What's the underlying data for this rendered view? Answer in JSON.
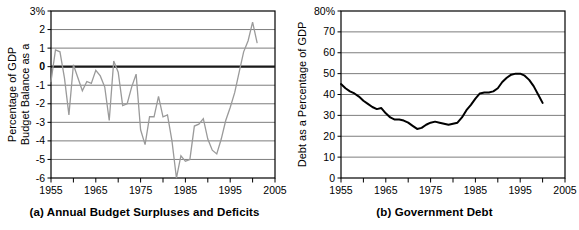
{
  "figure": {
    "panels": [
      {
        "id": "a",
        "caption": "(a) Annual Budget Surpluses and Deficits",
        "chart_data": {
          "type": "line",
          "title": "(a) Annual Budget Surpluses and Deficits",
          "xlabel": "Years",
          "ylabel": "Budget Balance as a Percentage of GDP",
          "xlim": [
            1955,
            2005
          ],
          "ylim": [
            -6,
            3
          ],
          "xticks": [
            1955,
            1965,
            1975,
            1985,
            1995,
            2005
          ],
          "xtick_labels": [
            "1955",
            "1965",
            "1975",
            "1985",
            "1995",
            "2005"
          ],
          "minor_xtick_step": 5,
          "yticks": [
            -6,
            -5,
            -4,
            -3,
            -2,
            -1,
            0,
            1,
            2,
            3
          ],
          "ytick_labels": [
            "-6",
            "-5",
            "-4",
            "-3",
            "-2",
            "-1",
            "0",
            "1",
            "2",
            "3%"
          ],
          "grid": true,
          "zero_line": 0,
          "line_color": "#9a9a9a",
          "series": [
            {
              "name": "Budget balance as a percentage of GDP",
              "x": [
                1955,
                1956,
                1957,
                1958,
                1959,
                1960,
                1961,
                1962,
                1963,
                1964,
                1965,
                1966,
                1967,
                1968,
                1969,
                1970,
                1971,
                1972,
                1973,
                1974,
                1975,
                1976,
                1977,
                1978,
                1979,
                1980,
                1981,
                1982,
                1983,
                1984,
                1985,
                1986,
                1987,
                1988,
                1989,
                1990,
                1991,
                1992,
                1993,
                1994,
                1995,
                1996,
                1997,
                1998,
                1999,
                2000,
                2001
              ],
              "values": [
                -0.8,
                0.9,
                0.8,
                -0.6,
                -2.6,
                0.1,
                -0.6,
                -1.3,
                -0.8,
                -0.9,
                -0.2,
                -0.5,
                -1.1,
                -2.9,
                0.3,
                -0.3,
                -2.1,
                -2.0,
                -1.1,
                -0.4,
                -3.4,
                -4.2,
                -2.7,
                -2.7,
                -1.6,
                -2.7,
                -2.6,
                -4.0,
                -6.0,
                -4.8,
                -5.1,
                -5.0,
                -3.2,
                -3.1,
                -2.8,
                -3.9,
                -4.5,
                -4.7,
                -3.9,
                -2.9,
                -2.2,
                -1.4,
                -0.3,
                0.8,
                1.4,
                2.4,
                1.3
              ]
            }
          ]
        },
        "axis": {
          "y_title_line1": "Budget Balance as a",
          "y_title_line2": "Percentage of GDP",
          "x_title": "Years"
        }
      },
      {
        "id": "b",
        "caption": "(b) Government Debt",
        "chart_data": {
          "type": "line",
          "title": "(b) Government Debt",
          "xlabel": "Years",
          "ylabel": "Debt as a Percentage of GDP",
          "xlim": [
            1955,
            2005
          ],
          "ylim": [
            0,
            80
          ],
          "xticks": [
            1955,
            1965,
            1975,
            1985,
            1995,
            2005
          ],
          "xtick_labels": [
            "1955",
            "1965",
            "1975",
            "1985",
            "1995",
            "2005"
          ],
          "minor_xtick_step": 5,
          "yticks": [
            0,
            10,
            20,
            30,
            40,
            50,
            60,
            70,
            80
          ],
          "ytick_labels": [
            "0",
            "10",
            "20",
            "30",
            "40",
            "50",
            "60",
            "70",
            "80%"
          ],
          "grid": true,
          "line_color": "#000000",
          "series": [
            {
              "name": "Debt as a percentage of GDP",
              "x": [
                1955,
                1956,
                1957,
                1958,
                1959,
                1960,
                1961,
                1962,
                1963,
                1964,
                1965,
                1966,
                1967,
                1968,
                1969,
                1970,
                1971,
                1972,
                1973,
                1974,
                1975,
                1976,
                1977,
                1978,
                1979,
                1980,
                1981,
                1982,
                1983,
                1984,
                1985,
                1986,
                1987,
                1988,
                1989,
                1990,
                1991,
                1992,
                1993,
                1994,
                1995,
                1996,
                1997,
                1998,
                1999,
                2000
              ],
              "values": [
                45.0,
                43.0,
                41.5,
                40.5,
                39.0,
                37.0,
                35.5,
                34.0,
                33.0,
                33.5,
                31.0,
                29.0,
                28.0,
                28.0,
                27.5,
                26.5,
                25.0,
                23.5,
                24.0,
                25.5,
                26.5,
                27.0,
                26.5,
                26.0,
                25.5,
                26.0,
                26.5,
                29.0,
                32.5,
                35.0,
                38.0,
                40.5,
                41.0,
                41.0,
                41.5,
                43.0,
                46.0,
                48.0,
                49.5,
                50.0,
                50.0,
                49.0,
                47.0,
                44.0,
                40.0,
                36.0
              ]
            }
          ]
        },
        "axis": {
          "y_title_line1": "Debt as a Percentage of GDP",
          "y_title_line2": "",
          "x_title": "Years"
        }
      }
    ]
  },
  "colors": {
    "grid": "#6e6e6e",
    "frame": "#000000",
    "line_a": "#9a9a9a",
    "line_b": "#000000",
    "zero_line": "#1a1a1a"
  }
}
